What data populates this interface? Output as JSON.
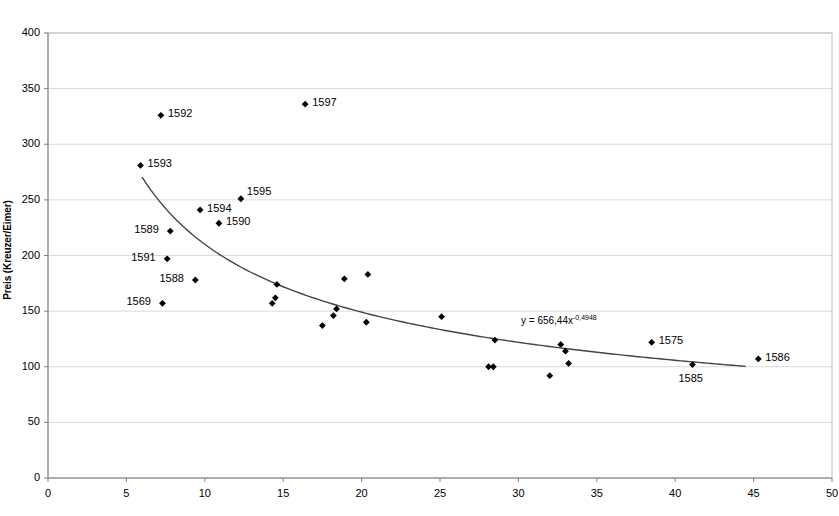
{
  "chart_data": {
    "type": "scatter",
    "title": "",
    "xlabel": "",
    "ylabel": "Preis (Kreuzer/Eimer)",
    "xlim": [
      0,
      50
    ],
    "ylim": [
      0,
      400
    ],
    "xticks": [
      0,
      5,
      10,
      15,
      20,
      25,
      30,
      35,
      40,
      45,
      50
    ],
    "yticks": [
      0,
      50,
      100,
      150,
      200,
      250,
      300,
      350,
      400
    ],
    "grid": "horizontal",
    "legend": "none",
    "marker": "diamond",
    "marker_color": "#000000",
    "trendline": {
      "type": "power",
      "equation_text": "y = 656,44x",
      "exponent_text": "-0,4948",
      "coefficient": 656.44,
      "exponent": -0.4948,
      "x_start": 6.0,
      "x_end": 44.5,
      "color": "#444444"
    },
    "points": [
      {
        "x": 7.2,
        "y": 326,
        "label": "1592",
        "label_pos": "right"
      },
      {
        "x": 16.4,
        "y": 336,
        "label": "1597",
        "label_pos": "right"
      },
      {
        "x": 5.9,
        "y": 281,
        "label": "1593",
        "label_pos": "right"
      },
      {
        "x": 12.3,
        "y": 251,
        "label": "1595",
        "label_pos": "right-up"
      },
      {
        "x": 9.7,
        "y": 241,
        "label": "1594",
        "label_pos": "right"
      },
      {
        "x": 10.9,
        "y": 229,
        "label": "1590",
        "label_pos": "right"
      },
      {
        "x": 7.8,
        "y": 222,
        "label": "1589",
        "label_pos": "left"
      },
      {
        "x": 7.6,
        "y": 197,
        "label": "1591",
        "label_pos": "left"
      },
      {
        "x": 9.4,
        "y": 178,
        "label": "1588",
        "label_pos": "left"
      },
      {
        "x": 7.3,
        "y": 157,
        "label": "1569",
        "label_pos": "left"
      },
      {
        "x": 14.6,
        "y": 174,
        "label": "",
        "label_pos": ""
      },
      {
        "x": 14.5,
        "y": 162,
        "label": "",
        "label_pos": ""
      },
      {
        "x": 14.3,
        "y": 157,
        "label": "",
        "label_pos": ""
      },
      {
        "x": 17.5,
        "y": 137,
        "label": "",
        "label_pos": ""
      },
      {
        "x": 18.2,
        "y": 146,
        "label": "",
        "label_pos": ""
      },
      {
        "x": 18.4,
        "y": 152,
        "label": "",
        "label_pos": ""
      },
      {
        "x": 18.9,
        "y": 179,
        "label": "",
        "label_pos": ""
      },
      {
        "x": 20.4,
        "y": 183,
        "label": "",
        "label_pos": ""
      },
      {
        "x": 20.3,
        "y": 140,
        "label": "",
        "label_pos": ""
      },
      {
        "x": 25.1,
        "y": 145,
        "label": "",
        "label_pos": ""
      },
      {
        "x": 28.1,
        "y": 100,
        "label": "",
        "label_pos": ""
      },
      {
        "x": 28.4,
        "y": 100,
        "label": "",
        "label_pos": ""
      },
      {
        "x": 28.5,
        "y": 124,
        "label": "",
        "label_pos": ""
      },
      {
        "x": 32.0,
        "y": 92,
        "label": "",
        "label_pos": ""
      },
      {
        "x": 32.7,
        "y": 120,
        "label": "",
        "label_pos": ""
      },
      {
        "x": 33.0,
        "y": 114,
        "label": "",
        "label_pos": ""
      },
      {
        "x": 33.2,
        "y": 103,
        "label": "",
        "label_pos": ""
      },
      {
        "x": 38.5,
        "y": 122,
        "label": "1575",
        "label_pos": "right"
      },
      {
        "x": 41.1,
        "y": 102,
        "label": "1585",
        "label_pos": "below"
      },
      {
        "x": 45.3,
        "y": 107,
        "label": "1586",
        "label_pos": "right"
      }
    ]
  },
  "axis": {
    "y_title": "Preis (Kreuzer/Eimer)",
    "y_tick_labels": [
      "400",
      "350",
      "300",
      "250",
      "200",
      "150",
      "100",
      "50",
      "0"
    ],
    "x_tick_labels": [
      "0",
      "5",
      "10",
      "15",
      "20",
      "25",
      "30",
      "35",
      "40",
      "45",
      "50"
    ]
  },
  "annotations": {
    "equation": "y = 656,44x",
    "equation_exponent": "-0,4948"
  }
}
